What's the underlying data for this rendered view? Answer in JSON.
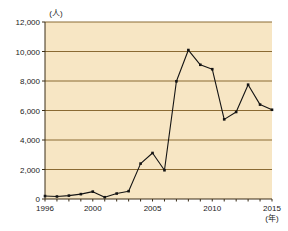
{
  "chart_data": {
    "type": "line",
    "title": "",
    "subtitle": "",
    "xlabel": "(年)",
    "ylabel": "(人)",
    "x": [
      1996,
      1997,
      1998,
      1999,
      2000,
      2001,
      2002,
      2003,
      2004,
      2005,
      2006,
      2007,
      2008,
      2009,
      2010,
      2011,
      2012,
      2013,
      2014,
      2015
    ],
    "values": [
      200,
      170,
      230,
      330,
      500,
      120,
      370,
      530,
      2400,
      3120,
      1950,
      7980,
      10100,
      9100,
      8800,
      5400,
      5900,
      7750,
      6400,
      6050
    ],
    "series": [
      {
        "name": "人数",
        "values": [
          200,
          170,
          230,
          330,
          500,
          120,
          370,
          530,
          2400,
          3120,
          1950,
          7980,
          10100,
          9100,
          8800,
          5400,
          5900,
          7750,
          6400,
          6050
        ]
      }
    ],
    "ylim": [
      0,
      12000
    ],
    "xlim": [
      1996,
      2015
    ],
    "ytick_labels": [
      "0",
      "2,000",
      "4,000",
      "6,000",
      "8,000",
      "10,000",
      "12,000"
    ],
    "ytick_values": [
      0,
      2000,
      4000,
      6000,
      8000,
      10000,
      12000
    ],
    "xtick_labels": [
      "1996",
      "2000",
      "2005",
      "2010",
      "2015"
    ],
    "xtick_values": [
      1996,
      2000,
      2005,
      2010,
      2015
    ],
    "grid": true,
    "grid_axis": "y",
    "legend": false,
    "legend_position": "none",
    "marker": "square",
    "colors": {
      "plot_background": "#f7e6c4",
      "gridline": "#8a6a33",
      "axis": "#3a2d16",
      "line": "#141414",
      "marker": "#141414",
      "text": "#1a1a1a",
      "page_background": "#ffffff"
    }
  }
}
